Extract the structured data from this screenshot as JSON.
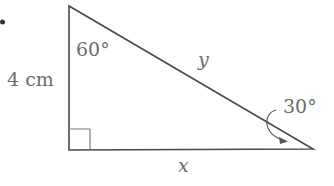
{
  "diagram": {
    "type": "right-triangle",
    "bullet": "•",
    "vertical_side": {
      "label": "4 cm"
    },
    "hypotenuse": {
      "label": "y"
    },
    "bottom_side": {
      "label": "x"
    },
    "top_angle": {
      "label": "60°"
    },
    "right_angle": {
      "label": "30°"
    },
    "right_angle_marker": "square",
    "colors": {
      "stroke": "#3a3a3a",
      "label": "#6b6b6b"
    }
  }
}
